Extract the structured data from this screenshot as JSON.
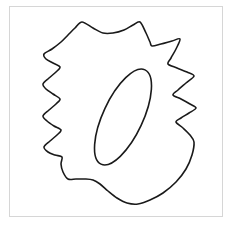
{
  "figure": {
    "title": "Outline drawing of a spiked closed curve with an inner tilted ellipse",
    "caption": "",
    "width": 233,
    "height": 229,
    "background_color": "#ffffff"
  },
  "panel": {
    "name": "figure-panel",
    "border_color": "#d6d6d6",
    "fill_color": "#ffffff",
    "x": 9,
    "y": 6,
    "width": 214,
    "height": 211
  },
  "chart_data": {
    "type": "line",
    "title": "Outline drawing of a spiked closed curve with an inner tilted ellipse",
    "xlabel": "",
    "ylabel": "",
    "xlim": [
      0,
      233
    ],
    "ylim": [
      0,
      229
    ],
    "grid": false,
    "legend": "none",
    "series": [
      {
        "name": "outer-spiked-contour",
        "closed": true,
        "stroke_color": "#1a1a1a",
        "stroke_width": 1.6,
        "fill": "none",
        "points": [
          [
            82,
            22
          ],
          [
            93,
            28
          ],
          [
            103,
            33
          ],
          [
            113,
            33
          ],
          [
            124,
            30
          ],
          [
            133,
            25
          ],
          [
            140,
            22
          ],
          [
            146,
            33
          ],
          [
            150,
            42
          ],
          [
            152,
            46
          ],
          [
            161,
            44
          ],
          [
            172,
            41
          ],
          [
            180,
            39
          ],
          [
            176,
            49
          ],
          [
            171,
            58
          ],
          [
            168,
            64
          ],
          [
            177,
            68
          ],
          [
            187,
            72
          ],
          [
            194,
            76
          ],
          [
            186,
            83
          ],
          [
            178,
            90
          ],
          [
            173,
            95
          ],
          [
            181,
            99
          ],
          [
            190,
            104
          ],
          [
            196,
            108
          ],
          [
            189,
            113
          ],
          [
            181,
            118
          ],
          [
            176,
            122
          ],
          [
            183,
            128
          ],
          [
            190,
            135
          ],
          [
            194,
            142
          ],
          [
            192,
            155
          ],
          [
            186,
            169
          ],
          [
            176,
            182
          ],
          [
            163,
            193
          ],
          [
            150,
            200
          ],
          [
            138,
            204
          ],
          [
            127,
            203
          ],
          [
            117,
            198
          ],
          [
            108,
            191
          ],
          [
            100,
            184
          ],
          [
            93,
            180
          ],
          [
            85,
            179
          ],
          [
            76,
            179
          ],
          [
            68,
            179
          ],
          [
            63,
            172
          ],
          [
            61,
            164
          ],
          [
            62,
            157
          ],
          [
            55,
            155
          ],
          [
            48,
            152
          ],
          [
            44,
            147
          ],
          [
            50,
            141
          ],
          [
            57,
            135
          ],
          [
            61,
            130
          ],
          [
            54,
            126
          ],
          [
            47,
            121
          ],
          [
            43,
            116
          ],
          [
            49,
            110
          ],
          [
            56,
            104
          ],
          [
            60,
            99
          ],
          [
            53,
            94
          ],
          [
            46,
            89
          ],
          [
            43,
            84
          ],
          [
            49,
            78
          ],
          [
            56,
            72
          ],
          [
            60,
            67
          ],
          [
            53,
            63
          ],
          [
            46,
            59
          ],
          [
            44,
            54
          ],
          [
            52,
            49
          ],
          [
            61,
            42
          ],
          [
            68,
            35
          ],
          [
            75,
            28
          ]
        ]
      },
      {
        "name": "inner-tilted-ellipse",
        "closed": true,
        "stroke_color": "#1a1a1a",
        "stroke_width": 1.6,
        "fill": "none",
        "center": [
          123,
          117
        ],
        "radius_x": 20,
        "radius_y": 52,
        "rotation_deg": 25
      }
    ]
  },
  "colors": {
    "stroke": "#1a1a1a",
    "frame": "#d6d6d6",
    "background": "#ffffff"
  }
}
